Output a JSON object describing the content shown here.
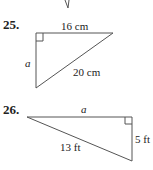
{
  "problems": [
    {
      "number": "25.",
      "shape": "right-triangle",
      "labels": {
        "top_leg": "16 cm",
        "left_leg": "a",
        "hypotenuse": "20 cm"
      }
    },
    {
      "number": "26.",
      "shape": "right-triangle",
      "labels": {
        "top_leg": "a",
        "right_leg": "5 ft",
        "hypotenuse": "13 ft"
      }
    }
  ]
}
